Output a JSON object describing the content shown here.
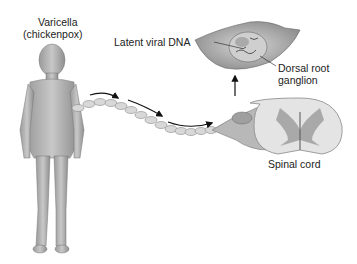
{
  "labels": {
    "varicella_line1": "Varicella",
    "varicella_line2": "(chickenpox)",
    "latent_dna": "Latent viral DNA",
    "drg_line1": "Dorsal root",
    "drg_line2": "ganglion",
    "spinal_cord": "Spinal cord"
  }
}
